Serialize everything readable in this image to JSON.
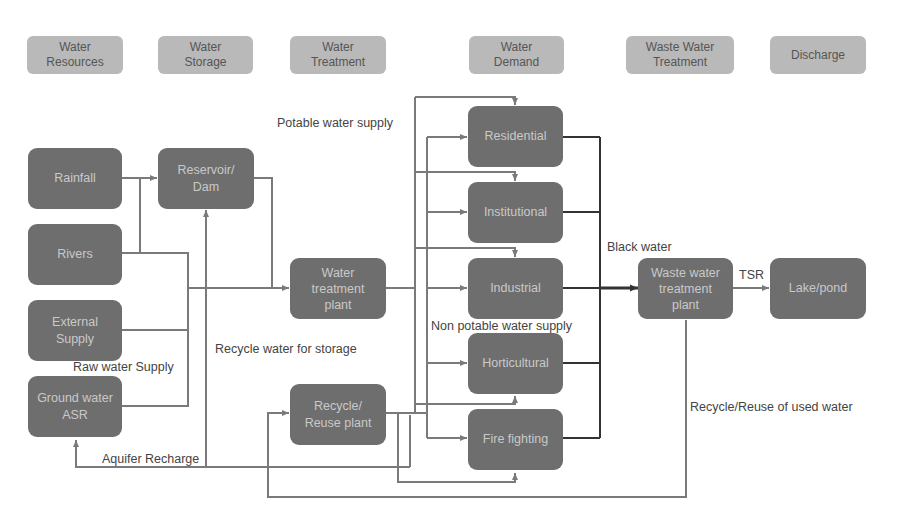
{
  "diagram": {
    "colors": {
      "header_fill": "#b9b9b9",
      "node_fill": "#6e6e6e",
      "node_text": "#c9c9c9",
      "line": "#7a7a7a",
      "black_water_line": "#333333",
      "label_text": "#444444"
    },
    "stages": [
      {
        "id": "water-resources",
        "label": "Water\nResources"
      },
      {
        "id": "water-storage",
        "label": "Water\nStorage"
      },
      {
        "id": "water-treatment",
        "label": "Water\nTreatment"
      },
      {
        "id": "water-demand",
        "label": "Water\nDemand"
      },
      {
        "id": "waste-water-treatment",
        "label": "Waste Water\nTreatment"
      },
      {
        "id": "discharge",
        "label": "Discharge"
      }
    ],
    "nodes": {
      "rainfall": "Rainfall",
      "rivers": "Rivers",
      "external_supply": "External\nSupply",
      "ground_water": "Ground water\nASR",
      "reservoir": "Reservoir/\nDam",
      "water_treatment_plant": "Water\ntreatment\nplant",
      "recycle_plant": "Recycle/\nReuse plant",
      "residential": "Residential",
      "institutional": "Institutional",
      "industrial": "Industrial",
      "horticultural": "Horticultural",
      "fire_fighting": "Fire fighting",
      "wastewater_plant": "Waste water\ntreatment\nplant",
      "lake": "Lake/pond"
    },
    "labels": {
      "potable": "Potable water supply",
      "non_potable": "Non potable water supply",
      "black_water": "Black water",
      "tsr": "TSR",
      "recycle_storage": "Recycle water for storage",
      "raw_water": "Raw water Supply",
      "aquifer": "Aquifer Recharge",
      "recycle_reuse": "Recycle/Reuse of used water"
    },
    "edges": [
      {
        "from": "Rainfall",
        "to": "Reservoir/Dam"
      },
      {
        "from": "Rivers",
        "to": "Reservoir/Dam"
      },
      {
        "from": "Rivers",
        "to": "Water treatment plant"
      },
      {
        "from": "External Supply",
        "to": "Water treatment plant"
      },
      {
        "from": "Ground water ASR",
        "to": "Water treatment plant"
      },
      {
        "from": "Reservoir/Dam",
        "to": "Water treatment plant"
      },
      {
        "from": "Water treatment plant",
        "to": "Residential"
      },
      {
        "from": "Water treatment plant",
        "to": "Institutional"
      },
      {
        "from": "Water treatment plant",
        "to": "Industrial"
      },
      {
        "from": "Water treatment plant",
        "to": "Horticultural"
      },
      {
        "from": "Water treatment plant",
        "to": "Fire fighting"
      },
      {
        "from": "Recycle/Reuse plant",
        "to": "Residential"
      },
      {
        "from": "Recycle/Reuse plant",
        "to": "Institutional"
      },
      {
        "from": "Recycle/Reuse plant",
        "to": "Industrial"
      },
      {
        "from": "Recycle/Reuse plant",
        "to": "Horticultural"
      },
      {
        "from": "Recycle/Reuse plant",
        "to": "Fire fighting"
      },
      {
        "from": "Recycle/Reuse plant",
        "to": "Reservoir/Dam"
      },
      {
        "from": "Recycle/Reuse plant",
        "to": "Ground water ASR"
      },
      {
        "from": "Demand nodes",
        "to": "Waste water treatment plant"
      },
      {
        "from": "Waste water treatment plant",
        "to": "Lake/pond"
      },
      {
        "from": "Waste water treatment plant",
        "to": "Recycle/Reuse plant"
      }
    ]
  }
}
